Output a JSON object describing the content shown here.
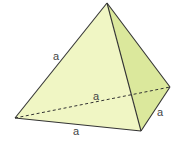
{
  "diagram": {
    "colors": {
      "front_face": "#f0f6c4",
      "side_face": "#dbe89c",
      "edge": "#333333",
      "label": "#444444"
    },
    "labels": [
      {
        "id": "left-edge",
        "text": "a"
      },
      {
        "id": "hidden-edge",
        "text": "a"
      },
      {
        "id": "right-bottom-edge",
        "text": "a"
      },
      {
        "id": "bottom-edge",
        "text": "a"
      }
    ]
  }
}
